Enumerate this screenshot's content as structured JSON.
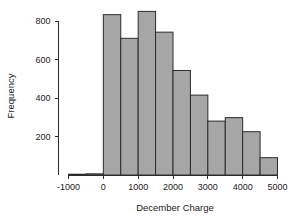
{
  "chart_data": {
    "type": "bar",
    "title": "",
    "subtitle": "",
    "xlabel": "December Charge",
    "ylabel": "Frequency",
    "xlim": [
      -1350,
      5150
    ],
    "ylim": [
      0,
      880
    ],
    "grid": false,
    "legend": null,
    "bin_width": 500,
    "bar_color": "#a6a6a6",
    "bar_edge_color": "#2b2b2b",
    "background_color": "#ffffff",
    "x_ticks": [
      -1000,
      0,
      1000,
      2000,
      3000,
      4000,
      5000
    ],
    "x_tick_labels": [
      "-1000",
      "0",
      "1000",
      "2000",
      "3000",
      "4000",
      "5000"
    ],
    "y_ticks": [
      200,
      400,
      600,
      800
    ],
    "y_tick_labels": [
      "200",
      "400",
      "600",
      "800"
    ],
    "categories": [
      "-1000 to -500",
      "-500 to 0",
      "0 to 500",
      "500 to 1000",
      "1000 to 1500",
      "1500 to 2000",
      "2000 to 2500",
      "2500 to 3000",
      "3000 to 3500",
      "3500 to 4000",
      "4000 to 4500",
      "4500 to 5000"
    ],
    "bins": [
      {
        "x0": -1000,
        "x1": -500,
        "value": 4
      },
      {
        "x0": -500,
        "x1": 0,
        "value": 6
      },
      {
        "x0": 0,
        "x1": 500,
        "value": 833
      },
      {
        "x0": 500,
        "x1": 1000,
        "value": 710
      },
      {
        "x0": 1000,
        "x1": 1500,
        "value": 850
      },
      {
        "x0": 1500,
        "x1": 2000,
        "value": 742
      },
      {
        "x0": 2000,
        "x1": 2500,
        "value": 543
      },
      {
        "x0": 2500,
        "x1": 3000,
        "value": 415
      },
      {
        "x0": 3000,
        "x1": 3500,
        "value": 280
      },
      {
        "x0": 3500,
        "x1": 4000,
        "value": 298
      },
      {
        "x0": 4000,
        "x1": 4500,
        "value": 225
      },
      {
        "x0": 4500,
        "x1": 5000,
        "value": 90
      }
    ],
    "values": [
      4,
      6,
      833,
      710,
      850,
      742,
      543,
      415,
      280,
      298,
      225,
      90
    ]
  }
}
